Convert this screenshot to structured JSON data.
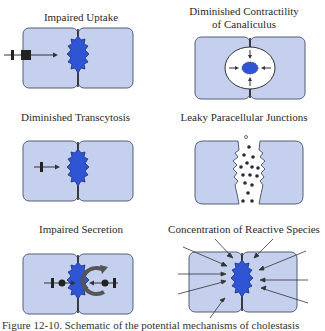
{
  "figure": {
    "colors": {
      "cell_fill": "#c5d0ee",
      "cell_stroke": "#555e72",
      "canaliculus_fill": "#2f55d4",
      "canaliculus_stroke": "#1b2f80",
      "arrow": "#222222"
    },
    "panels": [
      {
        "id": "impaired-uptake",
        "title": "Impaired Uptake"
      },
      {
        "id": "diminished-contractility",
        "title_line1": "Diminished Contractility",
        "title_line2": "of Canaliculus"
      },
      {
        "id": "diminished-transcytosis",
        "title": "Diminished Transcytosis"
      },
      {
        "id": "leaky-junctions",
        "title": "Leaky Paracellular Junctions"
      },
      {
        "id": "impaired-secretion",
        "title": "Impaired Secretion"
      },
      {
        "id": "reactive-species",
        "title": "Concentration of Reactive Species"
      }
    ],
    "caption": "Figure 12-10. Schematic of the potential mechanisms of cholestasis"
  }
}
